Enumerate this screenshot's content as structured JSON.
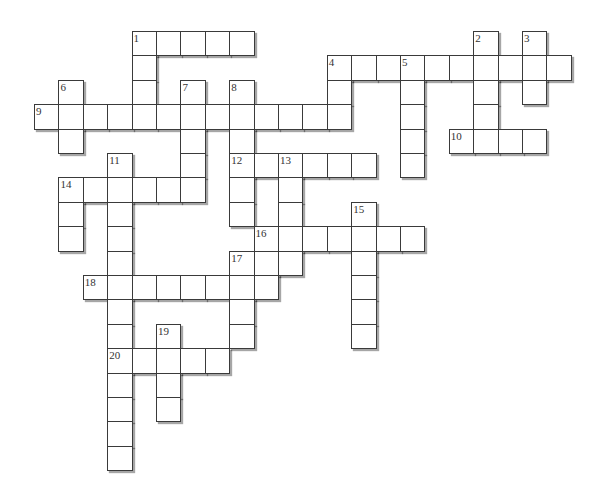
{
  "grid": {
    "origin_x": 34,
    "origin_y": 31,
    "cell_size": 24.4,
    "line_color": "#3a3a3a",
    "background": "#ffffff"
  },
  "entries": [
    {
      "number": "1",
      "direction": "across",
      "row": 0,
      "col": 4,
      "length": 5
    },
    {
      "number": "1",
      "direction": "down",
      "row": 0,
      "col": 4,
      "length": 4
    },
    {
      "number": "2",
      "direction": "down",
      "row": 0,
      "col": 18,
      "length": 5
    },
    {
      "number": "3",
      "direction": "down",
      "row": 0,
      "col": 20,
      "length": 3
    },
    {
      "number": "4",
      "direction": "across",
      "row": 1,
      "col": 12,
      "length": 10
    },
    {
      "number": "4",
      "direction": "down",
      "row": 1,
      "col": 12,
      "length": 3
    },
    {
      "number": "5",
      "direction": "down",
      "row": 1,
      "col": 15,
      "length": 5
    },
    {
      "number": "6",
      "direction": "down",
      "row": 2,
      "col": 1,
      "length": 3
    },
    {
      "number": "7",
      "direction": "down",
      "row": 2,
      "col": 6,
      "length": 5
    },
    {
      "number": "8",
      "direction": "down",
      "row": 2,
      "col": 8,
      "length": 6
    },
    {
      "number": "9",
      "direction": "across",
      "row": 3,
      "col": 0,
      "length": 13
    },
    {
      "number": "10",
      "direction": "across",
      "row": 4,
      "col": 17,
      "length": 4
    },
    {
      "number": "11",
      "direction": "down",
      "row": 5,
      "col": 3,
      "length": 13
    },
    {
      "number": "12",
      "direction": "across",
      "row": 5,
      "col": 8,
      "length": 6
    },
    {
      "number": "13",
      "direction": "down",
      "row": 5,
      "col": 10,
      "length": 5
    },
    {
      "number": "14",
      "direction": "across",
      "row": 6,
      "col": 1,
      "length": 6
    },
    {
      "number": "14",
      "direction": "down",
      "row": 6,
      "col": 1,
      "length": 3
    },
    {
      "number": "15",
      "direction": "down",
      "row": 7,
      "col": 13,
      "length": 6
    },
    {
      "number": "16",
      "direction": "across",
      "row": 8,
      "col": 9,
      "length": 7
    },
    {
      "number": "16",
      "direction": "down",
      "row": 8,
      "col": 9,
      "length": 3
    },
    {
      "number": "17",
      "direction": "down",
      "row": 9,
      "col": 8,
      "length": 4
    },
    {
      "number": "18",
      "direction": "across",
      "row": 10,
      "col": 2,
      "length": 8
    },
    {
      "number": "19",
      "direction": "down",
      "row": 12,
      "col": 5,
      "length": 4
    },
    {
      "number": "20",
      "direction": "across",
      "row": 13,
      "col": 3,
      "length": 5
    }
  ]
}
